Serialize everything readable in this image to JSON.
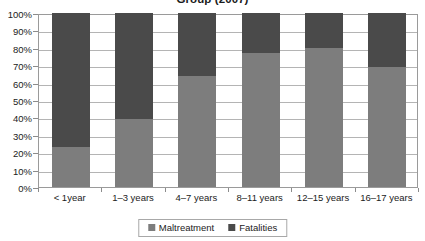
{
  "chart_data": {
    "type": "bar",
    "title": "Group (2007)",
    "xlabel": "",
    "ylabel": "",
    "ylim": [
      0,
      100
    ],
    "ytick_labels": [
      "100%",
      "90%",
      "80%",
      "70%",
      "60%",
      "50%",
      "40%",
      "30%",
      "20%",
      "10%",
      "0%"
    ],
    "ytick_values": [
      100,
      90,
      80,
      70,
      60,
      50,
      40,
      30,
      20,
      10,
      0
    ],
    "grid": true,
    "stacked": true,
    "legend_position": "bottom",
    "categories": [
      "< 1year",
      "1–3 years",
      "4–7 years",
      "8–11 years",
      "12–15 years",
      "16–17 years"
    ],
    "series": [
      {
        "name": "Maltreatment",
        "color": "#7d7d7d",
        "values": [
          23,
          39,
          64,
          77,
          80,
          69
        ]
      },
      {
        "name": "Fatalities",
        "color": "#4a4a4a",
        "values": [
          77,
          61,
          36,
          23,
          20,
          31
        ]
      }
    ]
  },
  "colors": {
    "maltreatment": "#7d7d7d",
    "fatalities": "#4a4a4a",
    "gridline": "#b4b4b4",
    "axis": "#9a9a9a",
    "text": "#1b1b1b",
    "background": "#ffffff"
  }
}
